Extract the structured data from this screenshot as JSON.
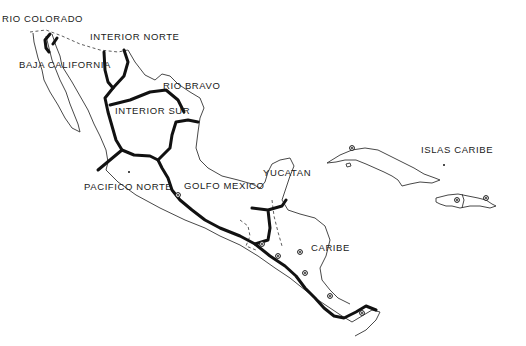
{
  "map": {
    "regions": [
      {
        "id": "rio-colorado",
        "label": "RIO COLORADO",
        "x": 2,
        "y": 13
      },
      {
        "id": "interior-norte",
        "label": "INTERIOR NORTE",
        "x": 90,
        "y": 31
      },
      {
        "id": "baja-california",
        "label": "BAJA CALIFORNIA",
        "x": 19,
        "y": 59
      },
      {
        "id": "rio-bravo",
        "label": "RIO BRAVO",
        "x": 163,
        "y": 80
      },
      {
        "id": "interior-sur",
        "label": "INTERIOR SUR",
        "x": 115,
        "y": 105
      },
      {
        "id": "yucatan",
        "label": "YUCATAN",
        "x": 263,
        "y": 167
      },
      {
        "id": "islas-caribe",
        "label": "ISLAS CARIBE",
        "x": 421,
        "y": 144
      },
      {
        "id": "golfo-mexico",
        "label": "GOLFO MEXICO",
        "x": 184,
        "y": 180
      },
      {
        "id": "pacifico-norte",
        "label": "PACIFICO NORTE",
        "x": 84,
        "y": 181
      },
      {
        "id": "caribe",
        "label": "CARIBE",
        "x": 311,
        "y": 242
      }
    ],
    "colors": {
      "route": "#111111",
      "coastline": "#333333",
      "background": "#ffffff"
    }
  }
}
